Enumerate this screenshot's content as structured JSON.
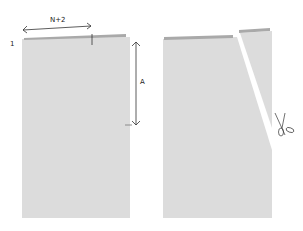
{
  "left_panel": {
    "row_label": "1",
    "width_label": "N+2",
    "height_label": "A"
  },
  "right_panel": {
    "tool_icon": "scissors-icon"
  },
  "colors": {
    "fabric": "#dcdcdc",
    "strip": "#a9a9a9",
    "line": "#333333"
  }
}
